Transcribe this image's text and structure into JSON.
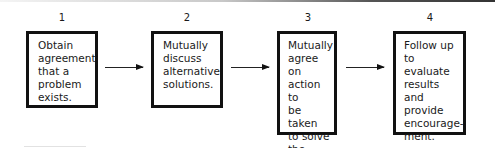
{
  "diagram": {
    "type": "flowchart",
    "steps": [
      {
        "number": "1",
        "text": "Obtain\nagreement\nthat a\nproblem\nexists."
      },
      {
        "number": "2",
        "text": "Mutually\ndiscuss\nalternative\nsolutions."
      },
      {
        "number": "3",
        "text": "Mutually\nagree on\naction to\nbe taken\nto solve\nthe\nproblem."
      },
      {
        "number": "4",
        "text": "Follow up\nto evaluate\nresults and\nprovide\nencourage-\nment."
      }
    ],
    "connectors": [
      {
        "from": "1",
        "to": "2"
      },
      {
        "from": "2",
        "to": "3"
      },
      {
        "from": "3",
        "to": "4"
      }
    ]
  }
}
